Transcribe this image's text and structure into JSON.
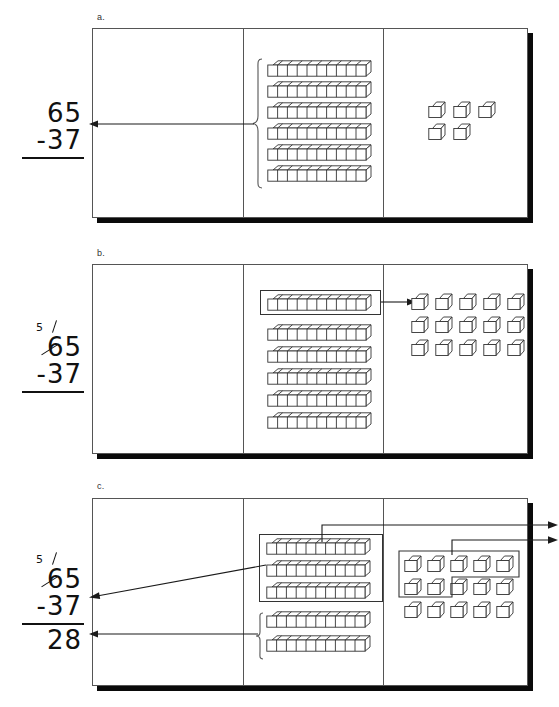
{
  "figure": {
    "caption_note": "Base-ten block model of two-digit subtraction with regrouping",
    "ink_color": "#1a1a1a",
    "shadow_color": "#0a0a0a"
  },
  "panels": [
    {
      "label": "a.",
      "name": "panel-a",
      "calc": {
        "minuend": "65",
        "subtrahend": "-37",
        "result": "",
        "regroup_digit": "",
        "show_result_rule": false,
        "show_regroup": false
      },
      "tens": {
        "rods": 6,
        "units_per_rod": 10,
        "boxed_rods": 0
      },
      "ones": {
        "cubes": 5,
        "row_counts": [
          3,
          2
        ],
        "boxed_cubes": 0
      },
      "brace": true,
      "arrows": [
        "brace-to-calc"
      ]
    },
    {
      "label": "b.",
      "name": "panel-b",
      "calc": {
        "minuend": "65",
        "subtrahend": "-37",
        "result": "",
        "regroup_digit": "5",
        "show_result_rule": false,
        "show_regroup": true
      },
      "tens": {
        "rods": 6,
        "units_per_rod": 10,
        "boxed_rods": 1
      },
      "ones": {
        "cubes": 15,
        "row_counts": [
          5,
          5,
          5
        ],
        "boxed_cubes": 0
      },
      "brace": false,
      "arrows": [
        "rod-to-ones"
      ]
    },
    {
      "label": "c.",
      "name": "panel-c",
      "calc": {
        "minuend": "65",
        "subtrahend": "-37",
        "result": "28",
        "regroup_digit": "5",
        "show_result_rule": true,
        "show_regroup": true
      },
      "tens": {
        "rods": 5,
        "units_per_rod": 10,
        "boxed_rods": 3,
        "remaining_rods": 2
      },
      "ones": {
        "cubes": 15,
        "row_counts": [
          5,
          5,
          5
        ],
        "boxed_cubes": 7,
        "remaining_cubes": 8
      },
      "brace": true,
      "arrows": [
        "tens-removed-out",
        "ones-removed-out",
        "tens-box-to-calc",
        "brace-to-result"
      ]
    }
  ],
  "icons": {
    "rod": "ten-rod-icon",
    "cube": "unit-cube-icon",
    "arrow": "arrow-right-icon",
    "brace": "curly-brace-icon"
  }
}
